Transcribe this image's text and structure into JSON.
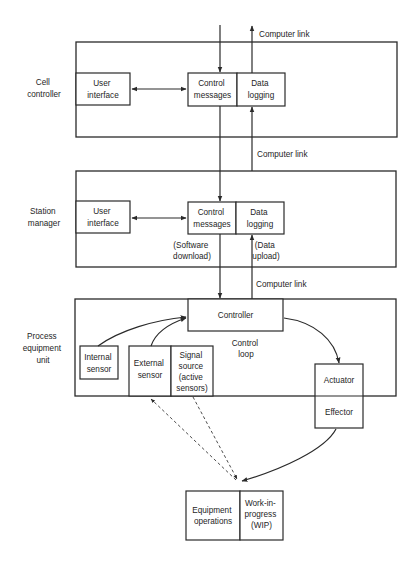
{
  "diagram": {
    "levels": [
      {
        "label": [
          "Cell",
          "controller"
        ],
        "user_interface": [
          "User",
          "interface"
        ],
        "control_messages": [
          "Control",
          "messages"
        ],
        "data_logging": [
          "Data",
          "logging"
        ]
      },
      {
        "label": [
          "Station",
          "manager"
        ],
        "user_interface": [
          "User",
          "interface"
        ],
        "control_messages": [
          "Control",
          "messages"
        ],
        "data_logging": [
          "Data",
          "logging"
        ],
        "software_download": [
          "(Software",
          "download)"
        ],
        "data_upload": [
          "(Data",
          "upload)"
        ]
      },
      {
        "label": [
          "Process",
          "equipment",
          "unit"
        ],
        "controller": "Controller",
        "control_loop": [
          "Control",
          "loop"
        ],
        "internal_sensor": [
          "Internal",
          "sensor"
        ],
        "external_sensor": [
          "External",
          "sensor"
        ],
        "signal_source": [
          "Signal",
          "source",
          "(active",
          "sensors)"
        ],
        "actuator": "Actuator",
        "effector": "Effector"
      }
    ],
    "computer_links": [
      "Computer link",
      "Computer link",
      "Computer link"
    ],
    "equipment_operations": [
      "Equipment",
      "operations"
    ],
    "work_in_progress": [
      "Work-in-",
      "progress",
      "(WIP)"
    ]
  }
}
